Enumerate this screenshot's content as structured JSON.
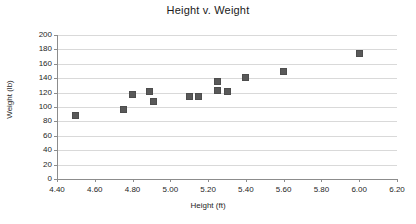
{
  "chart_data": {
    "type": "scatter",
    "title": "Height v. Weight",
    "xlabel": "Height (ft)",
    "ylabel": "Weight (lb)",
    "xlim": [
      4.4,
      6.2
    ],
    "ylim": [
      0,
      200
    ],
    "xticks": [
      "4.40",
      "4.60",
      "4.80",
      "5.00",
      "5.20",
      "5.40",
      "5.60",
      "5.80",
      "6.00",
      "6.20"
    ],
    "xtick_values": [
      4.4,
      4.6,
      4.8,
      5.0,
      5.2,
      5.4,
      5.6,
      5.8,
      6.0,
      6.2
    ],
    "yticks": [
      "0",
      "20",
      "40",
      "60",
      "80",
      "100",
      "120",
      "140",
      "160",
      "180",
      "200"
    ],
    "ytick_values": [
      0,
      20,
      40,
      60,
      80,
      100,
      120,
      140,
      160,
      180,
      200
    ],
    "grid": true,
    "legend": false,
    "marker_color": "#595959",
    "marker_shape": "square",
    "points": [
      {
        "x": 4.5,
        "y": 88
      },
      {
        "x": 4.75,
        "y": 96
      },
      {
        "x": 4.8,
        "y": 118
      },
      {
        "x": 4.89,
        "y": 122
      },
      {
        "x": 4.91,
        "y": 107
      },
      {
        "x": 5.1,
        "y": 114
      },
      {
        "x": 5.15,
        "y": 114
      },
      {
        "x": 5.25,
        "y": 135
      },
      {
        "x": 5.25,
        "y": 123
      },
      {
        "x": 5.3,
        "y": 121
      },
      {
        "x": 5.4,
        "y": 141
      },
      {
        "x": 5.6,
        "y": 150
      },
      {
        "x": 6.0,
        "y": 174
      }
    ]
  }
}
